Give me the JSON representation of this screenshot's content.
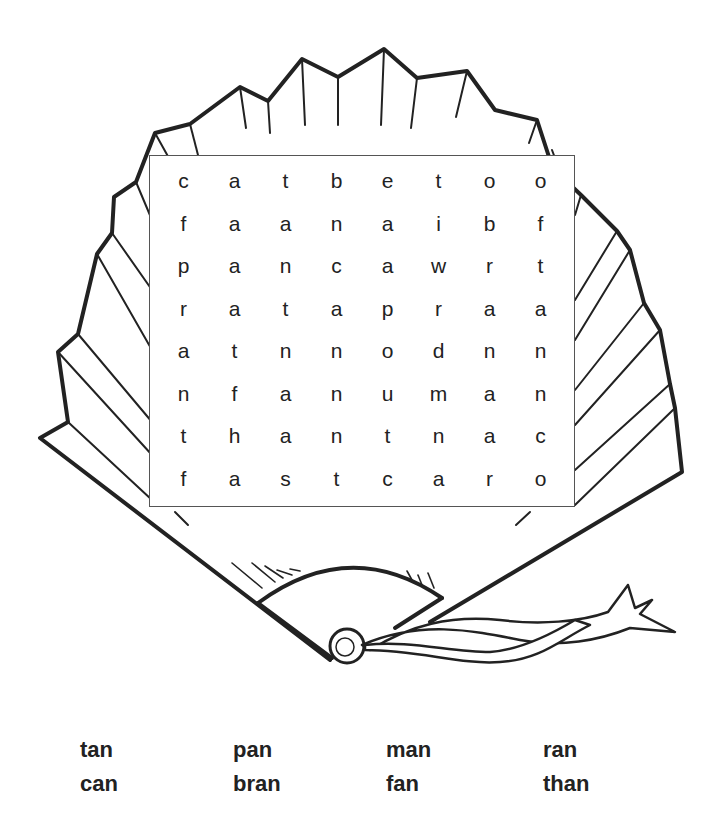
{
  "puzzle": {
    "type": "word-search",
    "illustration": "hand-fan",
    "grid": [
      [
        "c",
        "a",
        "t",
        "b",
        "e",
        "t",
        "o",
        "o"
      ],
      [
        "f",
        "a",
        "a",
        "n",
        "a",
        "i",
        "b",
        "f"
      ],
      [
        "p",
        "a",
        "n",
        "c",
        "a",
        "w",
        "r",
        "t"
      ],
      [
        "r",
        "a",
        "t",
        "a",
        "p",
        "r",
        "a",
        "a"
      ],
      [
        "a",
        "t",
        "n",
        "n",
        "o",
        "d",
        "n",
        "n"
      ],
      [
        "n",
        "f",
        "a",
        "n",
        "u",
        "m",
        "a",
        "n"
      ],
      [
        "t",
        "h",
        "a",
        "n",
        "t",
        "n",
        "a",
        "c"
      ],
      [
        "f",
        "a",
        "s",
        "t",
        "c",
        "a",
        "r",
        "o"
      ]
    ]
  },
  "word_list": {
    "words": [
      "tan",
      "pan",
      "man",
      "ran",
      "can",
      "bran",
      "fan",
      "than"
    ]
  }
}
